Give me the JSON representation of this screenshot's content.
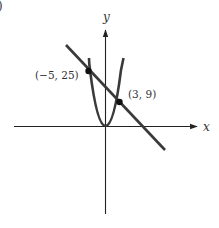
{
  "figure": {
    "panel_label_fragment": ")",
    "axes": {
      "x_label": "x",
      "y_label": "y"
    },
    "curves": [
      {
        "name": "parabola",
        "equation_shape": "y = x^2",
        "color": "#3a3a3a"
      },
      {
        "name": "line",
        "color": "#3a3a3a"
      }
    ],
    "points": [
      {
        "name": "left-intersection",
        "label": "(−5, 25)",
        "x": -5,
        "y": 25
      },
      {
        "name": "right-intersection",
        "label": "(3, 9)",
        "x": 3,
        "y": 9
      }
    ],
    "colors": {
      "ink": "#333333",
      "background": "#ffffff"
    }
  }
}
